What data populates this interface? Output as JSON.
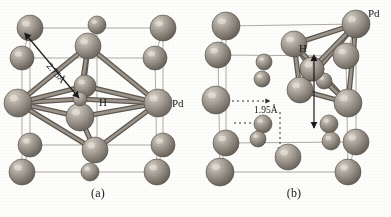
{
  "figure": {
    "type": "crystal-structure-diagram",
    "panels": [
      {
        "id": "a",
        "caption": "(a)",
        "site": "octahedral",
        "labels": {
          "host_atom": "Pd",
          "interstitial_atom": "H",
          "distance": "2.75Å"
        },
        "colors": {
          "host_sphere": "#9a948c",
          "host_sphere_light": "#cdc7bd",
          "host_sphere_dark": "#6d675f",
          "bond": "#7d776e",
          "cell_edge": "#a7a199",
          "label_text": "#141414",
          "arrow": "#1a1a1a"
        },
        "host_atoms": [
          {
            "cx": 30,
            "cy": 28,
            "r": 13,
            "shade": "corner"
          },
          {
            "cx": 97,
            "cy": 25,
            "r": 9,
            "shade": "edge"
          },
          {
            "cx": 163,
            "cy": 28,
            "r": 13,
            "shade": "corner"
          },
          {
            "cx": 22,
            "cy": 58,
            "r": 12,
            "shade": "corner"
          },
          {
            "cx": 88,
            "cy": 46,
            "r": 13,
            "shade": "face"
          },
          {
            "cx": 155,
            "cy": 58,
            "r": 12,
            "shade": "corner"
          },
          {
            "cx": 18,
            "cy": 103,
            "r": 14,
            "shade": "face"
          },
          {
            "cx": 85,
            "cy": 86,
            "r": 11,
            "shade": "edge"
          },
          {
            "cx": 158,
            "cy": 103,
            "r": 14,
            "shade": "face"
          },
          {
            "cx": 80,
            "cy": 117,
            "r": 14,
            "shade": "center"
          },
          {
            "cx": 30,
            "cy": 145,
            "r": 12,
            "shade": "corner"
          },
          {
            "cx": 95,
            "cy": 150,
            "r": 13,
            "shade": "face"
          },
          {
            "cx": 163,
            "cy": 145,
            "r": 12,
            "shade": "corner"
          },
          {
            "cx": 22,
            "cy": 172,
            "r": 13,
            "shade": "corner"
          },
          {
            "cx": 90,
            "cy": 172,
            "r": 9,
            "shade": "edge"
          },
          {
            "cx": 157,
            "cy": 172,
            "r": 13,
            "shade": "corner"
          }
        ],
        "interstitial": {
          "cx": 80,
          "cy": 99,
          "r": 7
        },
        "cell_edges": [
          [
            30,
            28,
            163,
            28
          ],
          [
            30,
            28,
            22,
            58
          ],
          [
            163,
            28,
            155,
            58
          ],
          [
            22,
            58,
            155,
            58
          ],
          [
            22,
            58,
            22,
            172
          ],
          [
            155,
            58,
            157,
            172
          ],
          [
            30,
            28,
            30,
            145
          ],
          [
            163,
            28,
            163,
            145
          ],
          [
            30,
            145,
            163,
            145
          ],
          [
            22,
            172,
            157,
            172
          ],
          [
            30,
            145,
            22,
            172
          ],
          [
            163,
            145,
            157,
            172
          ],
          [
            97,
            25,
            90,
            58
          ],
          [
            97,
            25,
            97,
            145
          ]
        ],
        "bonds": [
          [
            88,
            46,
            18,
            103
          ],
          [
            88,
            46,
            158,
            103
          ],
          [
            88,
            46,
            80,
            117
          ],
          [
            88,
            46,
            80,
            99
          ],
          [
            18,
            103,
            80,
            117
          ],
          [
            158,
            103,
            80,
            117
          ],
          [
            18,
            103,
            80,
            99
          ],
          [
            158,
            103,
            80,
            99
          ],
          [
            95,
            150,
            18,
            103
          ],
          [
            95,
            150,
            158,
            103
          ],
          [
            95,
            150,
            80,
            117
          ],
          [
            85,
            86,
            18,
            103
          ],
          [
            85,
            86,
            158,
            103
          ]
        ],
        "dimension_arrow": {
          "x1": 28,
          "y1": 37,
          "x2": 79,
          "y2": 98
        }
      },
      {
        "id": "b",
        "caption": "(b)",
        "site": "tetrahedral",
        "labels": {
          "host_atom": "Pd",
          "interstitial_atom": "H",
          "distance": "1.95Å"
        },
        "colors": {
          "host_sphere": "#9a948c",
          "host_sphere_light": "#cdc7bd",
          "host_sphere_dark": "#6d675f",
          "bond": "#7d776e",
          "cell_edge": "#a7a199",
          "label_text": "#141414",
          "arrow": "#1a1a1a"
        },
        "host_atoms": [
          {
            "cx": 30,
            "cy": 26,
            "r": 14,
            "shade": "corner"
          },
          {
            "cx": 160,
            "cy": 24,
            "r": 14,
            "shade": "corner"
          },
          {
            "cx": 22,
            "cy": 55,
            "r": 13,
            "shade": "corner"
          },
          {
            "cx": 98,
            "cy": 44,
            "r": 13,
            "shade": "face"
          },
          {
            "cx": 150,
            "cy": 56,
            "r": 13,
            "shade": "face"
          },
          {
            "cx": 68,
            "cy": 62,
            "r": 8,
            "shade": "edge"
          },
          {
            "cx": 66,
            "cy": 79,
            "r": 8,
            "shade": "edge"
          },
          {
            "cx": 116,
            "cy": 69,
            "r": 12,
            "shade": "center"
          },
          {
            "cx": 128,
            "cy": 81,
            "r": 8,
            "shade": "edge"
          },
          {
            "cx": 20,
            "cy": 100,
            "r": 14,
            "shade": "face"
          },
          {
            "cx": 104,
            "cy": 90,
            "r": 13,
            "shade": "face"
          },
          {
            "cx": 152,
            "cy": 103,
            "r": 14,
            "shade": "face"
          },
          {
            "cx": 67,
            "cy": 124,
            "r": 9,
            "shade": "edge"
          },
          {
            "cx": 133,
            "cy": 124,
            "r": 9,
            "shade": "edge"
          },
          {
            "cx": 30,
            "cy": 143,
            "r": 13,
            "shade": "corner"
          },
          {
            "cx": 62,
            "cy": 139,
            "r": 8,
            "shade": "edge"
          },
          {
            "cx": 135,
            "cy": 141,
            "r": 9,
            "shade": "edge"
          },
          {
            "cx": 160,
            "cy": 142,
            "r": 13,
            "shade": "corner"
          },
          {
            "cx": 92,
            "cy": 157,
            "r": 13,
            "shade": "face"
          },
          {
            "cx": 24,
            "cy": 172,
            "r": 14,
            "shade": "corner"
          },
          {
            "cx": 152,
            "cy": 172,
            "r": 13,
            "shade": "corner"
          }
        ],
        "interstitial": {
          "cx": 116,
          "cy": 69,
          "r": 12
        },
        "cell_edges": [
          [
            30,
            26,
            160,
            24
          ],
          [
            30,
            26,
            22,
            55
          ],
          [
            160,
            24,
            150,
            56
          ],
          [
            22,
            55,
            150,
            56
          ],
          [
            22,
            55,
            24,
            172
          ],
          [
            150,
            56,
            152,
            172
          ],
          [
            30,
            26,
            30,
            143
          ],
          [
            160,
            24,
            160,
            142
          ],
          [
            30,
            143,
            160,
            142
          ],
          [
            24,
            172,
            152,
            172
          ],
          [
            30,
            143,
            24,
            172
          ],
          [
            160,
            142,
            152,
            172
          ]
        ],
        "bonds": [
          [
            160,
            24,
            98,
            44
          ],
          [
            160,
            24,
            104,
            90
          ],
          [
            160,
            24,
            152,
            103
          ],
          [
            160,
            24,
            116,
            69
          ],
          [
            98,
            44,
            104,
            90
          ],
          [
            98,
            44,
            116,
            69
          ],
          [
            98,
            44,
            152,
            103
          ],
          [
            104,
            90,
            152,
            103
          ],
          [
            104,
            90,
            116,
            69
          ],
          [
            152,
            103,
            116,
            69
          ]
        ],
        "dimension_arrow": {
          "x1": 118,
          "y1": 60,
          "x2": 118,
          "y2": 128
        },
        "dotted_arrows": [
          {
            "x1": 36,
            "y1": 101,
            "x2": 74,
            "y2": 101
          },
          {
            "x1": 38,
            "y1": 123,
            "x2": 70,
            "y2": 123
          },
          {
            "x1": 84,
            "y1": 112,
            "x2": 84,
            "y2": 152
          }
        ]
      }
    ]
  }
}
